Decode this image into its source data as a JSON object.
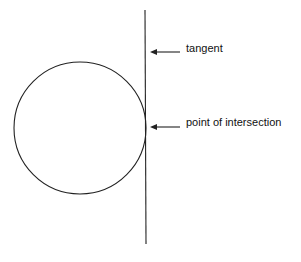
{
  "diagram": {
    "labels": {
      "tangent": "tangent",
      "point": "point of intersection"
    },
    "colors": {
      "stroke": "#222222",
      "background": "#ffffff"
    }
  }
}
